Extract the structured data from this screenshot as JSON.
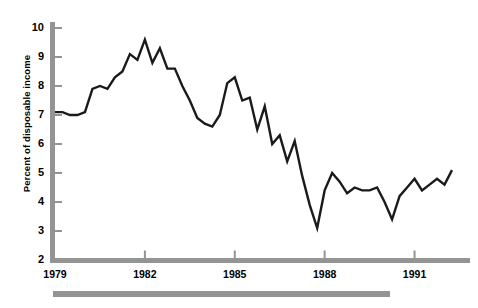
{
  "chart": {
    "axis_title_y": "Percent of disposable income",
    "y_ticks": [
      "10",
      "9",
      "8",
      "7",
      "6",
      "5",
      "4",
      "3",
      "2"
    ],
    "x_ticks": [
      "1979",
      "1982",
      "1985",
      "1988",
      "1991"
    ],
    "axis_color": "#949494",
    "line_color": "#1a1a1a",
    "footer_bar_color": "#949494",
    "background": "#ffffff"
  },
  "chart_data": {
    "type": "line",
    "title": "",
    "subtitle": "",
    "xlabel": "",
    "ylabel": "Percent of disposable income",
    "xlim": [
      1979,
      1992.25
    ],
    "ylim": [
      2,
      10
    ],
    "ytick_values": [
      10,
      9,
      8,
      7,
      6,
      5,
      4,
      3,
      2
    ],
    "xtick_values": [
      1979,
      1982,
      1985,
      1988,
      1991
    ],
    "grid": false,
    "legend": null,
    "series": [
      {
        "name": "Personal saving rate",
        "x": [
          1979.0,
          1979.25,
          1979.5,
          1979.75,
          1980.0,
          1980.25,
          1980.5,
          1980.75,
          1981.0,
          1981.25,
          1981.5,
          1981.75,
          1982.0,
          1982.25,
          1982.5,
          1982.75,
          1983.0,
          1983.25,
          1983.5,
          1983.75,
          1984.0,
          1984.25,
          1984.5,
          1984.75,
          1985.0,
          1985.25,
          1985.5,
          1985.75,
          1986.0,
          1986.25,
          1986.5,
          1986.75,
          1987.0,
          1987.25,
          1987.5,
          1987.75,
          1988.0,
          1988.25,
          1988.5,
          1988.75,
          1989.0,
          1989.25,
          1989.5,
          1989.75,
          1990.0,
          1990.25,
          1990.5,
          1990.75,
          1991.0,
          1991.25,
          1991.5,
          1991.75,
          1992.0,
          1992.25
        ],
        "y": [
          7.1,
          7.1,
          7.0,
          7.0,
          7.1,
          7.9,
          8.0,
          7.9,
          8.3,
          8.5,
          9.1,
          8.9,
          9.6,
          8.8,
          9.3,
          8.6,
          8.6,
          8.0,
          7.5,
          6.9,
          6.7,
          6.6,
          7.0,
          8.1,
          8.3,
          7.5,
          7.6,
          6.5,
          7.3,
          6.0,
          6.3,
          5.4,
          6.1,
          4.9,
          3.9,
          3.1,
          4.4,
          5.0,
          4.7,
          4.3,
          4.5,
          4.4,
          4.4,
          4.5,
          4.0,
          3.4,
          4.2,
          4.5,
          4.8,
          4.4,
          4.6,
          4.8,
          4.6,
          5.1
        ]
      }
    ]
  }
}
